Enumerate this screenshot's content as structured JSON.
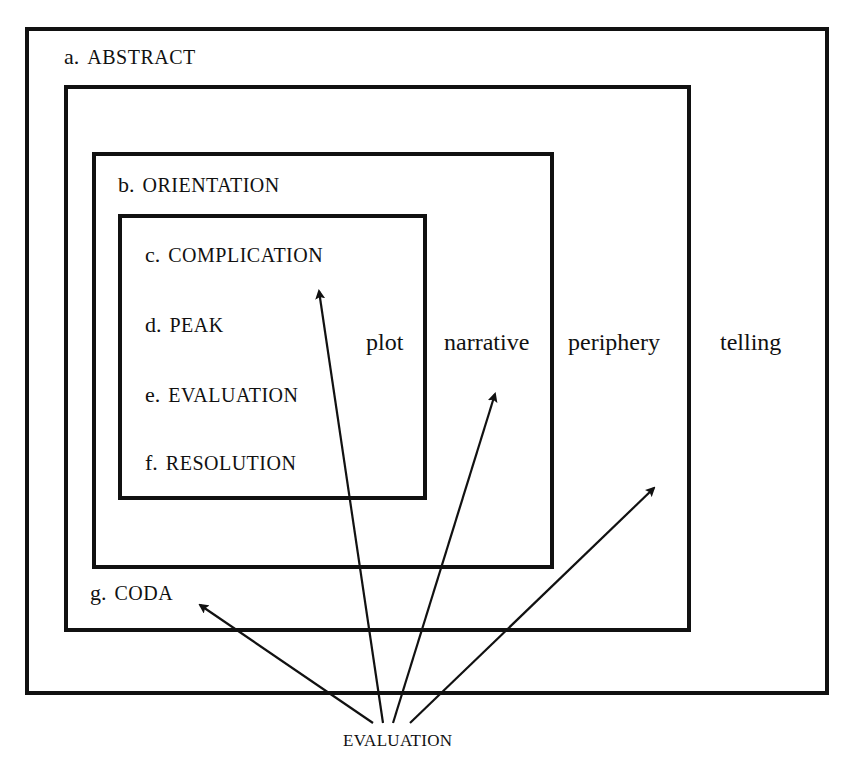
{
  "diagram": {
    "boxes": {
      "telling": {
        "label_letter": "a.",
        "label_term": "ABSTRACT",
        "column_label": "telling"
      },
      "periphery": {
        "label_letter": "g.",
        "label_term": "CODA",
        "column_label": "periphery"
      },
      "narrative": {
        "label_letter": "b.",
        "label_term": "ORIENTATION",
        "column_label": "narrative"
      },
      "plot": {
        "column_label": "plot",
        "items": [
          {
            "letter": "c.",
            "term": "COMPLICATION"
          },
          {
            "letter": "d.",
            "term": "PEAK"
          },
          {
            "letter": "e.",
            "term": "EVALUATION"
          },
          {
            "letter": "f.",
            "term": "RESOLUTION"
          }
        ]
      }
    },
    "source_label": "EVALUATION",
    "arrows": [
      {
        "target": "coda"
      },
      {
        "target": "plot"
      },
      {
        "target": "narrative"
      },
      {
        "target": "periphery"
      }
    ],
    "colors": {
      "line": "#111111",
      "background": "#ffffff"
    }
  }
}
